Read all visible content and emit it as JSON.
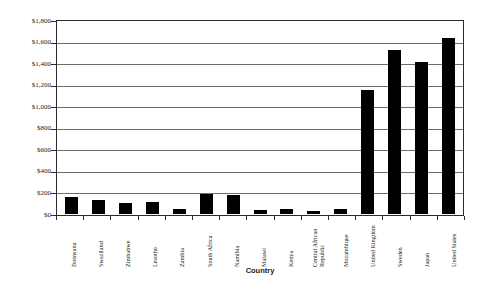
{
  "chart_data": {
    "type": "bar",
    "title": "",
    "xlabel": "Country",
    "ylabel": "Public Health Expenditure",
    "ylim": [
      0,
      1800
    ],
    "ytick_values": [
      0,
      200,
      400,
      600,
      800,
      1000,
      1200,
      1400,
      1600,
      1800
    ],
    "ytick_labels": [
      "$0",
      "$200",
      "$400",
      "$600",
      "$800",
      "$1,000",
      "$1,200",
      "$1,400",
      "$1,600",
      "$1,800"
    ],
    "grid": true,
    "legend": null,
    "bar_color": "#000000",
    "categories": [
      "Botswana",
      "Swaziland",
      "Zimbabwe",
      "Lesotho",
      "Zambia",
      "South Africa",
      "Namibia",
      "Malawi",
      "Kenya",
      "Central African Republic",
      "Mozambique",
      "United Kingdom",
      "Sweden",
      "Japan",
      "United States"
    ],
    "category_label_lines": [
      [
        "Botswana"
      ],
      [
        "Swaziland"
      ],
      [
        "Zimbabwe"
      ],
      [
        "Lesotho"
      ],
      [
        "Zambia"
      ],
      [
        "South Africa"
      ],
      [
        "Namibia"
      ],
      [
        "Malawi"
      ],
      [
        "Kenya"
      ],
      [
        "Central African",
        "Republic"
      ],
      [
        "Mozambique"
      ],
      [
        "United Kingdom"
      ],
      [
        "Sweden"
      ],
      [
        "Japan"
      ],
      [
        "United States"
      ]
    ],
    "values": [
      155,
      130,
      100,
      110,
      45,
      190,
      180,
      40,
      45,
      25,
      45,
      1150,
      1520,
      1410,
      1635
    ]
  }
}
